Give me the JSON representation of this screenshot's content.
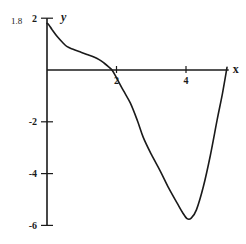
{
  "chart_data": {
    "type": "line",
    "title": "",
    "xlabel": "x",
    "ylabel": "y",
    "xlim": [
      0,
      5.2
    ],
    "ylim": [
      -6,
      2
    ],
    "grid": false,
    "legend": null,
    "x_ticks": [
      {
        "value": 2,
        "label": "2"
      },
      {
        "value": 4,
        "label": "4"
      }
    ],
    "y_ticks": [
      {
        "value": 2,
        "label": "2"
      },
      {
        "value": -2,
        "label": "-2"
      },
      {
        "value": -4,
        "label": "-4"
      },
      {
        "value": -6,
        "label": "-6"
      }
    ],
    "annotations": [
      {
        "text": "1.8",
        "x": 0,
        "y": 1.8,
        "note": "y-intercept value labeled left of y-axis"
      }
    ],
    "series": [
      {
        "name": "f(x)",
        "color": "#1a1a1a",
        "x": [
          0.0,
          0.05,
          0.15,
          0.3,
          0.45,
          0.58,
          0.75,
          0.95,
          1.15,
          1.35,
          1.5,
          1.64,
          1.75,
          1.87,
          2.0,
          2.2,
          2.4,
          2.6,
          2.77,
          3.0,
          3.26,
          3.5,
          3.75,
          3.9,
          4.03,
          4.15,
          4.3,
          4.5,
          4.7,
          4.9,
          5.05,
          5.18
        ],
        "values": [
          1.8,
          1.75,
          1.55,
          1.28,
          1.06,
          0.9,
          0.8,
          0.7,
          0.6,
          0.5,
          0.4,
          0.27,
          0.15,
          0.0,
          -0.3,
          -0.8,
          -1.28,
          -1.95,
          -2.6,
          -3.25,
          -3.9,
          -4.55,
          -5.15,
          -5.5,
          -5.74,
          -5.72,
          -5.4,
          -4.5,
          -3.3,
          -1.9,
          -0.9,
          0.1
        ]
      }
    ]
  }
}
